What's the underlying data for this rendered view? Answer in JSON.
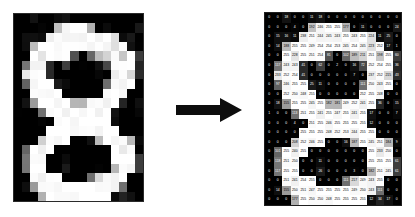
{
  "figure": {
    "digit_label": "8",
    "arrow": {
      "name": "right-arrow",
      "direction": "right",
      "color": "#0d0d0d"
    },
    "colors": {
      "background": "#ffffff",
      "ink_min": "#000000",
      "ink_max": "#ffffff",
      "border": "#1e1e1e"
    }
  },
  "chart_data": {
    "type": "heatmap",
    "xlabel": "",
    "ylabel": "",
    "value_range": [
      0,
      255
    ],
    "rows": 20,
    "cols": 16,
    "grid": [
      [
        0,
        0,
        18,
        0,
        0,
        11,
        18,
        0,
        0,
        0,
        0,
        0,
        0,
        0,
        0,
        0
      ],
      [
        0,
        0,
        0,
        4,
        0,
        192,
        246,
        255,
        255,
        177,
        0,
        11,
        0,
        0,
        0,
        24
      ],
      [
        0,
        15,
        16,
        11,
        238,
        251,
        244,
        245,
        243,
        255,
        243,
        255,
        224,
        11,
        25,
        0
      ],
      [
        0,
        14,
        188,
        255,
        255,
        249,
        254,
        254,
        253,
        245,
        254,
        245,
        223,
        252,
        17,
        1
      ],
      [
        0,
        0,
        255,
        228,
        255,
        251,
        254,
        81,
        0,
        102,
        189,
        211,
        251,
        198,
        255,
        60
      ],
      [
        0,
        117,
        243,
        243,
        41,
        0,
        62,
        0,
        2,
        0,
        16,
        72,
        252,
        254,
        255,
        36
      ],
      [
        0,
        233,
        252,
        254,
        41,
        0,
        0,
        0,
        0,
        0,
        7,
        0,
        237,
        252,
        215,
        43
      ],
      [
        0,
        97,
        246,
        255,
        255,
        25,
        11,
        0,
        0,
        0,
        0,
        111,
        250,
        243,
        255,
        0
      ],
      [
        0,
        0,
        252,
        250,
        248,
        255,
        0,
        0,
        0,
        0,
        0,
        252,
        255,
        248,
        0,
        0
      ],
      [
        0,
        18,
        155,
        255,
        255,
        245,
        255,
        182,
        181,
        249,
        252,
        241,
        255,
        36,
        0,
        15
      ],
      [
        1,
        0,
        0,
        113,
        251,
        255,
        241,
        255,
        247,
        255,
        241,
        255,
        17,
        0,
        0,
        7
      ],
      [
        0,
        0,
        0,
        4,
        0,
        251,
        255,
        246,
        255,
        255,
        255,
        255,
        12,
        0,
        0,
        0
      ],
      [
        0,
        0,
        0,
        0,
        255,
        255,
        255,
        248,
        252,
        253,
        244,
        255,
        255,
        0,
        0,
        0
      ],
      [
        0,
        0,
        0,
        208,
        252,
        246,
        255,
        0,
        0,
        16,
        187,
        255,
        245,
        251,
        184,
        9
      ],
      [
        0,
        101,
        255,
        240,
        255,
        0,
        0,
        0,
        0,
        0,
        0,
        0,
        255,
        233,
        250,
        0
      ],
      [
        0,
        118,
        251,
        250,
        0,
        0,
        11,
        0,
        0,
        0,
        0,
        0,
        255,
        255,
        255,
        61
      ],
      [
        0,
        117,
        255,
        255,
        0,
        0,
        26,
        0,
        0,
        0,
        3,
        0,
        182,
        251,
        245,
        61
      ],
      [
        0,
        0,
        251,
        241,
        254,
        255,
        0,
        0,
        0,
        111,
        217,
        249,
        243,
        255,
        0,
        0
      ],
      [
        0,
        14,
        155,
        250,
        251,
        247,
        255,
        255,
        255,
        255,
        249,
        250,
        243,
        111,
        0,
        0
      ],
      [
        0,
        0,
        0,
        177,
        255,
        250,
        250,
        248,
        255,
        255,
        255,
        255,
        12,
        34,
        17,
        0
      ]
    ],
    "legend": "pixel intensity values 0 (black) to 255 (white)"
  },
  "digit_grid": {
    "rows": 20,
    "cols": 16,
    "note": "grayscale rendering of the same matrix"
  }
}
